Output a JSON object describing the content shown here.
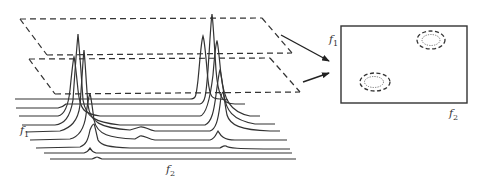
{
  "figure": {
    "stack_plot": {
      "axis_f1_label": "f",
      "axis_f1_sub": "1",
      "axis_f2_label": "f",
      "axis_f2_sub": "2",
      "trace_count": 9,
      "peak_positions": [
        "left cluster near f2 low",
        "right cluster near f2 high"
      ]
    },
    "planes": [
      {
        "name": "upper-contour-plane",
        "style": "dashed"
      },
      {
        "name": "lower-contour-plane",
        "style": "dashed"
      }
    ],
    "arrows": [
      {
        "from": "upper-contour-plane",
        "to": "contour-map"
      },
      {
        "from": "lower-contour-plane",
        "to": "contour-map"
      }
    ],
    "contour_map": {
      "axis_f1_label": "f",
      "axis_f1_sub": "1",
      "axis_f2_label": "f",
      "axis_f2_sub": "2",
      "peaks": [
        {
          "position": "upper-right",
          "outer_contour": "dashed",
          "inner_contour": "dotted"
        },
        {
          "position": "lower-left",
          "outer_contour": "dashed",
          "inner_contour": "dotted"
        }
      ]
    },
    "colors": {
      "line": "#333333",
      "background": "#ffffff"
    }
  }
}
